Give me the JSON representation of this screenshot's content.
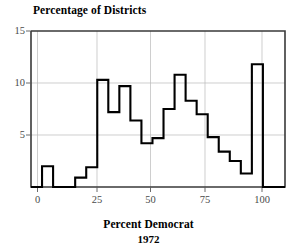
{
  "chart_data": {
    "type": "bar",
    "title": "Percentage of Districts",
    "xlabel": "Percent Democrat",
    "xlabel_sub": "1972",
    "ylabel": "",
    "grid": true,
    "legend": null,
    "xlim": [
      -5,
      110
    ],
    "ylim": [
      0,
      15
    ],
    "xticks": [
      0,
      25,
      50,
      75,
      100
    ],
    "xtick_labels": [
      "0",
      "25",
      "50",
      "75",
      "100"
    ],
    "yticks": [
      5,
      10,
      15
    ],
    "ytick_labels": [
      "5",
      "10",
      "15"
    ],
    "bin_width": 5,
    "bin_starts": [
      -5,
      0,
      5,
      10,
      15,
      20,
      25,
      30,
      35,
      40,
      45,
      50,
      55,
      60,
      65,
      70,
      75,
      80,
      85,
      90,
      95,
      100,
      105
    ],
    "categories": [
      "-5",
      "0",
      "5",
      "10",
      "15",
      "20",
      "25",
      "30",
      "35",
      "40",
      "45",
      "50",
      "55",
      "60",
      "65",
      "70",
      "75",
      "80",
      "85",
      "90",
      "95",
      "100",
      "105"
    ],
    "values": [
      0,
      2.0,
      0,
      0,
      0.9,
      1.9,
      10.3,
      7.2,
      9.7,
      6.4,
      4.2,
      4.7,
      7.5,
      10.8,
      8.3,
      7.0,
      4.8,
      3.4,
      2.5,
      1.3,
      11.8,
      0,
      0
    ],
    "colors": {
      "line": "#000000",
      "grid": "#b9b9b9",
      "frame": "#3a3a3a",
      "text": "#000000",
      "tick_text": "#4a4a4a",
      "background": "#ffffff"
    }
  }
}
